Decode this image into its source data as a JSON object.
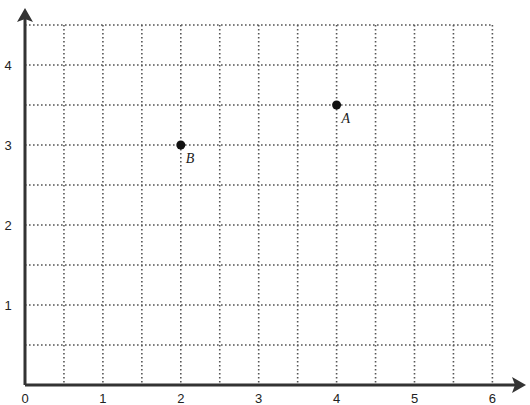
{
  "chart_data": {
    "type": "scatter",
    "title": "",
    "xlabel": "",
    "ylabel": "",
    "xlim": [
      0,
      6
    ],
    "ylim": [
      0,
      4.5
    ],
    "grid": true,
    "grid_step": 0.5,
    "grid_style": "dotted",
    "x_ticks": [
      "0",
      "1",
      "2",
      "3",
      "4",
      "5",
      "6"
    ],
    "y_ticks": [
      "1",
      "2",
      "3",
      "4"
    ],
    "points": [
      {
        "label": "A",
        "x": 4,
        "y": 3.5
      },
      {
        "label": "B",
        "x": 2,
        "y": 3
      }
    ]
  },
  "colors": {
    "axis": "#333333",
    "grid": "#555555",
    "point": "#111111"
  }
}
